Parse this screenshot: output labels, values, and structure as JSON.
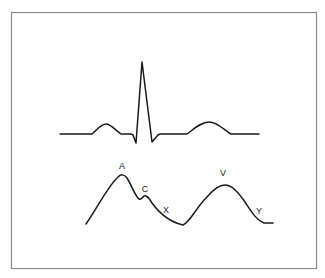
{
  "figure": {
    "traces": [
      {
        "id": "ecg",
        "name": "ECG tracing",
        "components": [
          "P wave",
          "QRS complex",
          "T wave"
        ]
      },
      {
        "id": "jvp",
        "name": "Jugular venous pulse waveform",
        "components": [
          "a wave",
          "c wave",
          "x descent",
          "v wave",
          "y descent"
        ]
      }
    ],
    "labels": {
      "a": "A",
      "c": "C",
      "x": "X",
      "v": "V",
      "y": "Y"
    },
    "colors": {
      "trace": "#1a1a1a",
      "frame": "#8a8a8a",
      "background": "#ffffff"
    }
  }
}
